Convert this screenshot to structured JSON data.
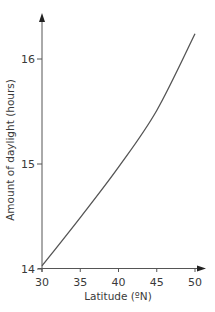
{
  "chart_data": {
    "type": "line",
    "title": "",
    "xlabel": "Latitude (ºN)",
    "ylabel": "Amount of daylight (hours)",
    "xlim": [
      30,
      50
    ],
    "ylim": [
      14,
      16.3
    ],
    "grid": false,
    "legend": null,
    "x_ticks": [
      30,
      35,
      40,
      45,
      50
    ],
    "x_tick_labels": [
      "30",
      "35",
      "40",
      "45",
      "50"
    ],
    "y_ticks": [
      14,
      15,
      16
    ],
    "y_tick_labels": [
      "14",
      "15",
      "16"
    ],
    "series": [
      {
        "name": "Daylight hours",
        "color": "#555555",
        "x": [
          30,
          35,
          40,
          45,
          50
        ],
        "values": [
          14.03,
          14.49,
          14.97,
          15.51,
          16.24
        ]
      }
    ]
  },
  "colors": {
    "axis": "#555555",
    "line": "#555555",
    "text": "#3a3a3a",
    "background": "#ffffff"
  }
}
